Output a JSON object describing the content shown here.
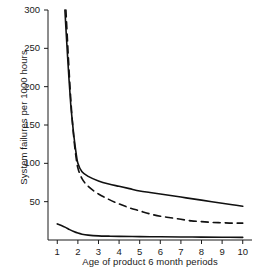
{
  "chart_data": {
    "type": "line",
    "title": "",
    "xlabel": "Age of product 6 month periods",
    "ylabel": "System failures per 1000 hours",
    "xlim": [
      0.55,
      10.45
    ],
    "ylim": [
      0,
      300
    ],
    "xticks": [
      "1",
      "2",
      "3",
      "4",
      "5",
      "6",
      "7",
      "8",
      "9",
      "10"
    ],
    "yticks": [
      "50",
      "100",
      "150",
      "200",
      "250",
      "300"
    ],
    "grid": false,
    "legend": "none",
    "line_color": "#111111",
    "series": [
      {
        "name": "upper-solid-curve",
        "style": "solid",
        "x": [
          1.37,
          1.45,
          1.55,
          1.65,
          1.72,
          1.8,
          1.9,
          2.0,
          2.2,
          2.5,
          3.0,
          3.5,
          4.0,
          4.5,
          5.0,
          5.5,
          6.0,
          6.5,
          7.0,
          7.5,
          8.0,
          8.5,
          9.0,
          9.5,
          10.0
        ],
        "values": [
          300,
          262,
          218,
          178,
          158,
          137,
          116,
          100,
          89,
          83,
          77,
          73,
          70,
          67,
          64,
          62,
          60,
          58,
          56,
          54,
          52,
          50,
          48,
          46,
          44
        ]
      },
      {
        "name": "middle-dashed-curve",
        "style": "dashed",
        "x": [
          1.42,
          1.5,
          1.6,
          1.7,
          1.8,
          1.9,
          2.0,
          2.2,
          2.5,
          3.0,
          3.5,
          4.0,
          4.5,
          5.0,
          5.5,
          6.0,
          6.5,
          7.0,
          7.5,
          8.0,
          8.5,
          9.0,
          9.5,
          10.0
        ],
        "values": [
          300,
          258,
          208,
          166,
          134,
          110,
          94,
          80,
          70,
          60,
          53,
          47,
          42,
          38,
          34,
          31,
          29,
          27,
          25,
          24,
          23,
          22.5,
          22,
          22
        ]
      },
      {
        "name": "lower-solid-curve",
        "style": "solid",
        "x": [
          1.0,
          1.2,
          1.4,
          1.6,
          1.8,
          2.0,
          2.2,
          2.5,
          3.0,
          3.5,
          4.0,
          5.0,
          6.0,
          7.0,
          8.0,
          9.0,
          10.0
        ],
        "values": [
          21,
          19,
          16.5,
          13.5,
          11,
          9,
          7.6,
          6.4,
          5.4,
          5.0,
          4.7,
          4.4,
          4.2,
          4.0,
          3.8,
          3.6,
          3.4
        ]
      }
    ]
  }
}
